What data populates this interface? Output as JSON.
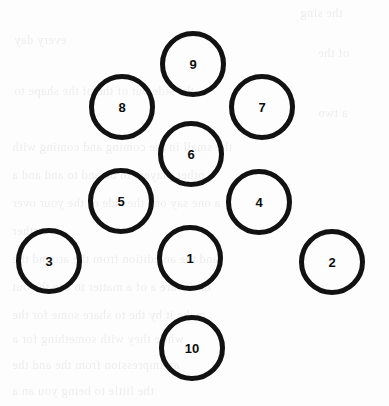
{
  "figure": {
    "kind": "numbered-circle-layout",
    "background_color": "#fdfdfd",
    "stroke_color": "#121212",
    "label_color": "#0d0d0d",
    "stroke_width": 5,
    "circle_diameter": 66,
    "width": 389,
    "height": 406
  },
  "circles": [
    {
      "label": "9",
      "cx": 193,
      "cy": 64,
      "r": 33
    },
    {
      "label": "8",
      "cx": 122,
      "cy": 107,
      "r": 33
    },
    {
      "label": "7",
      "cx": 262,
      "cy": 107,
      "r": 33
    },
    {
      "label": "6",
      "cx": 191,
      "cy": 154,
      "r": 33
    },
    {
      "label": "5",
      "cx": 121,
      "cy": 201,
      "r": 33
    },
    {
      "label": "4",
      "cx": 259,
      "cy": 202,
      "r": 33
    },
    {
      "label": "3",
      "cx": 49,
      "cy": 261,
      "r": 33
    },
    {
      "label": "1",
      "cx": 190,
      "cy": 258,
      "r": 33
    },
    {
      "label": "2",
      "cx": 332,
      "cy": 262,
      "r": 33
    },
    {
      "label": "10",
      "cx": 192,
      "cy": 348,
      "r": 33
    }
  ],
  "bleed_text": [
    {
      "text": "the sing",
      "x": 300,
      "y": 6
    },
    {
      "text": "every day",
      "x": 14,
      "y": 33
    },
    {
      "text": "of the",
      "x": 318,
      "y": 46
    },
    {
      "text": "the side out of the of the shape to",
      "x": 14,
      "y": 84
    },
    {
      "text": "a two",
      "x": 318,
      "y": 106
    },
    {
      "text": "the small in the coming and coming with",
      "x": 12,
      "y": 140
    },
    {
      "text": "other players to be and to and and a",
      "x": 12,
      "y": 168
    },
    {
      "text": "a one say  one  the side of the  your over",
      "x": 12,
      "y": 196
    },
    {
      "text": "other",
      "x": 12,
      "y": 224
    },
    {
      "text": "and the  an edition from the  around the",
      "x": 12,
      "y": 252
    },
    {
      "text": "of the are a of a matter to use the out",
      "x": 12,
      "y": 280
    },
    {
      "text": "make it by the  to share some for the",
      "x": 12,
      "y": 308
    },
    {
      "text": "while they with  something  for  a",
      "x": 12,
      "y": 332
    },
    {
      "text": "an  impression  from  the  and  the",
      "x": 12,
      "y": 358
    },
    {
      "text": "the  little to  being  you  an  a",
      "x": 12,
      "y": 384
    }
  ]
}
